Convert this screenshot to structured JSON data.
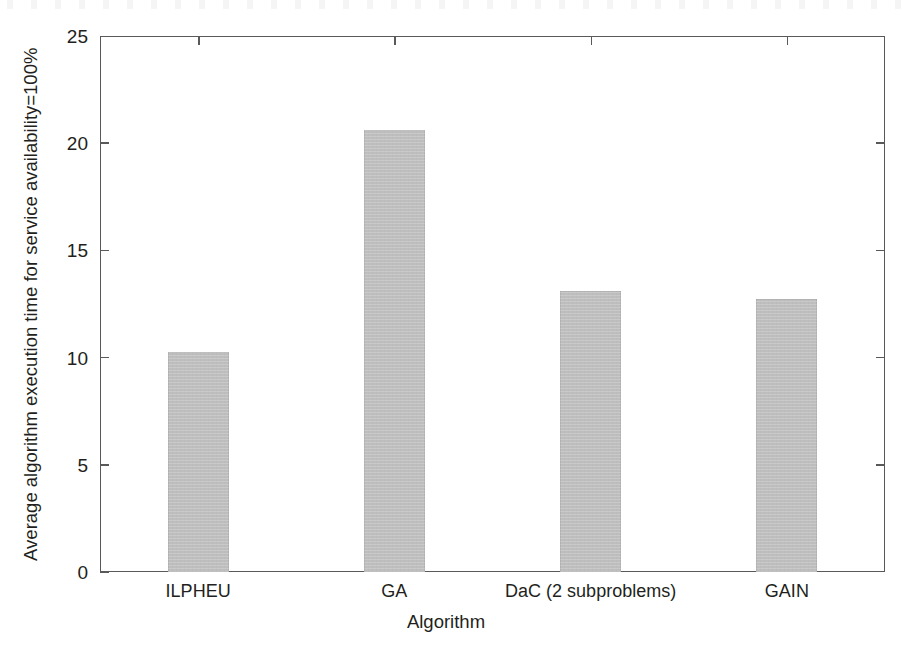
{
  "chart_data": {
    "type": "bar",
    "title": "",
    "xlabel": "Algorithm",
    "ylabel": "Average algorithm execution time for service availability=100%",
    "categories": [
      "ILPHEU",
      "GA",
      "DaC (2 subproblems)",
      "GAIN"
    ],
    "values": [
      10.25,
      20.6,
      13.1,
      12.75
    ],
    "ylim": [
      0,
      25
    ],
    "yticks": [
      "0",
      "5",
      "10",
      "15",
      "20",
      "25"
    ],
    "ytick_values": [
      0,
      5,
      10,
      15,
      20,
      25
    ],
    "grid": false,
    "legend": null,
    "bar_color": "#bebebe",
    "axis_color": "#58595b"
  },
  "axes": {
    "y_title": "Average algorithm execution time for service availability=100%",
    "x_title": "Algorithm"
  }
}
